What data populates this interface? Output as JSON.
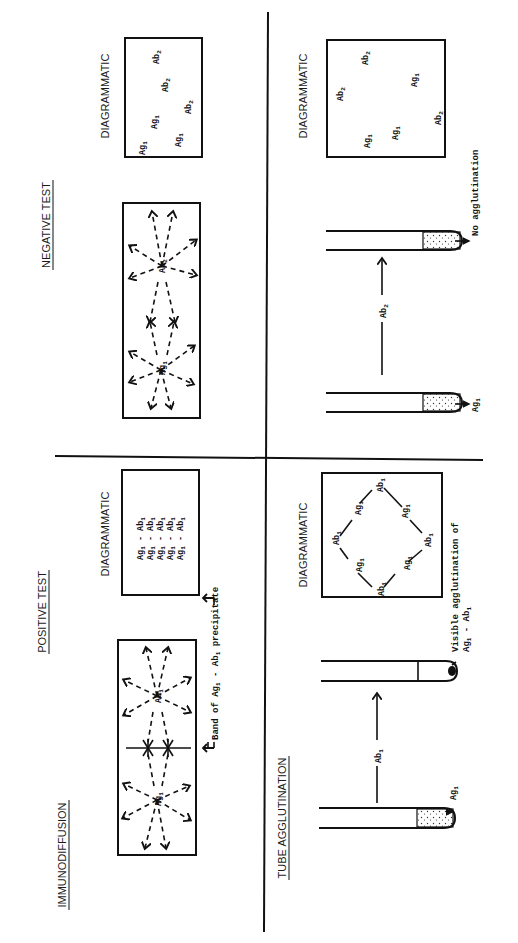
{
  "figure": {
    "orientation": "rotated 90 degrees counter-clockwise",
    "sections": {
      "immunodiffusion": {
        "title": "IMMUNODIFFUSION"
      },
      "tube_agglutination": {
        "title": "TUBE AGGLUTINATION"
      }
    },
    "columns": {
      "positive": {
        "title": "POSITIVE TEST"
      },
      "negative": {
        "title": "NEGATIVE TEST"
      }
    },
    "diagrammatic_label": "DIAGRAMMATIC",
    "immunodiffusion_positive": {
      "well_1": "Ag1",
      "well_2": "Ab1",
      "band_label": "Band of Ag1 - Ab1 precipitate",
      "diagram_rows": [
        "Ag1 - Ab1",
        "Ag1 - Ab1",
        "Ag1 - Ab1",
        "Ag1 - Ab1",
        "Ag1 - Ab1"
      ]
    },
    "immunodiffusion_negative": {
      "well_1": "Ag1",
      "well_2": "Ab2",
      "diagram_items": [
        "Ag1",
        "Ag1",
        "Ag1",
        "Ab2",
        "Ab2",
        "Ab2"
      ]
    },
    "tube_positive": {
      "tube_1_label": "Ag1",
      "transfer_label": "Ab1",
      "result_label_line1": "Visible agglutination of",
      "result_label_line2": "Ag1 - Ab1",
      "lattice": [
        "Ab1",
        "Ag1",
        "Ab1",
        "Ag1",
        "Ab1",
        "Ag1",
        "Ab1",
        "Ag1"
      ]
    },
    "tube_negative": {
      "tube_1_label": "Ag1",
      "transfer_label": "Ab2",
      "result_label": "No agglutination",
      "diagram_items": [
        "Ab2",
        "Ab2",
        "Ab2",
        "Ag1",
        "Ag1",
        "Ag1"
      ]
    },
    "text": {
      "Ag": "Ag",
      "Ab": "Ab",
      "one": "1",
      "two": "2",
      "dash": "-",
      "band_of": "Band of ",
      "precipitate": " precipitate",
      "visible_agg": "Visible agglutination of",
      "no_agg": "No agglutination"
    }
  }
}
